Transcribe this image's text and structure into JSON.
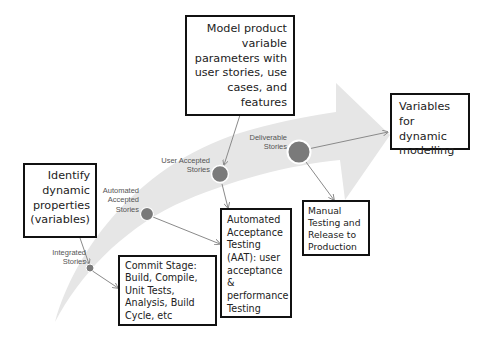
{
  "diagram": {
    "colors": {
      "arrow_fill": "#e6e6e6",
      "node_fill": "#7a7a7a",
      "node_stroke": "#ffffff",
      "connector": "#8a8a8a",
      "box_border": "#111111",
      "text": "#222222"
    },
    "boxes": {
      "model_product": "Model product variable parameters with user stories, use cases, and features",
      "identify": "Identify dynamic properties (variables)",
      "variables": "Variables for dynamic modelling",
      "commit_stage": "Commit Stage: Build, Compile, Unit Tests, Analysis, Build Cycle, etc",
      "aat": "Automated Acceptance Testing (AAT): user acceptance & performance Testing",
      "manual": "Manual Testing and Release to Production"
    },
    "stages": [
      {
        "line1": "Integrated",
        "line2": "Stories"
      },
      {
        "line1": "Automated",
        "line2": "Accepted",
        "line3": "Stories"
      },
      {
        "line1": "User Accepted",
        "line2": "Stories"
      },
      {
        "line1": "Deliverable",
        "line2": "Stories"
      }
    ]
  }
}
